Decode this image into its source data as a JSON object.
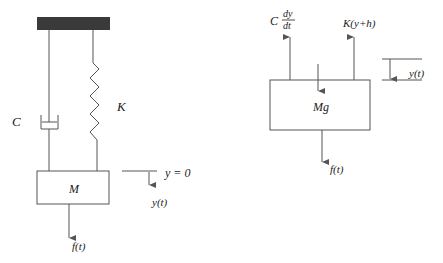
{
  "left_diagram": {
    "damper_label": "C",
    "spring_label": "K",
    "mass_label": "M",
    "reference_label": "y = 0",
    "displacement_label": "y(t)",
    "force_label": "f(t)"
  },
  "right_diagram": {
    "damper_force_prefix": "C",
    "damper_force_num": "dy",
    "damper_force_den": "dt",
    "spring_force_label": "K(y+h)",
    "weight_label": "Mg",
    "displacement_label": "y(t)",
    "force_label": "f(t)"
  },
  "colors": {
    "line": "#555555",
    "ceiling": "#3a3a3a",
    "text": "#222222"
  }
}
